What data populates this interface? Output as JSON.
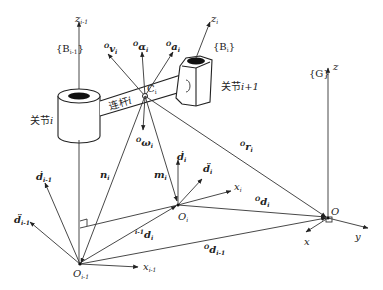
{
  "diagram": {
    "frames": {
      "B_im1": "{B",
      "B_im1_sub": "i-1",
      "B_im1_close": "}",
      "B_i": "{B",
      "B_i_sub": "i",
      "B_i_close": "}",
      "G": "{G}"
    },
    "axes": {
      "z_im1": "z",
      "z_im1_sub": "i-1",
      "z_i": "z",
      "z_i_sub": "i",
      "z_G": "z",
      "x_im1": "x",
      "x_im1_sub": "i-1",
      "x_i": "x",
      "x_i_sub": "i",
      "x_G": "x",
      "y_G": "y"
    },
    "points": {
      "O_im1": "O",
      "O_im1_sub": "i-1",
      "O_i": "O",
      "O_i_sub": "i",
      "O": "O",
      "C_i": "C",
      "C_i_sub": "i"
    },
    "components": {
      "joint_i": "关节",
      "joint_i_var": "i",
      "joint_ip1": "关节",
      "joint_ip1_var": "i+1",
      "link_i": "连杆",
      "link_i_var": "i"
    },
    "vectors": {
      "v_i": {
        "sup": "O",
        "name": "v",
        "sub": "i"
      },
      "alpha_i": {
        "sup": "O",
        "name": "α",
        "sub": "i"
      },
      "a_i": {
        "sup": "O",
        "name": "a",
        "sub": "i"
      },
      "omega_i": {
        "sup": "O",
        "name": "ω",
        "sub": "i"
      },
      "n_i": {
        "name": "n",
        "sub": "i"
      },
      "m_i": {
        "name": "m",
        "sub": "i"
      },
      "r_i": {
        "sup": "O",
        "name": "r",
        "sub": "i"
      },
      "d_i_dot": {
        "name": "ḋ",
        "sub": "i"
      },
      "d_i_ddot": {
        "name": "d̈",
        "sub": "i"
      },
      "d_im1_dot": {
        "name": "ḋ",
        "sub": "i-1"
      },
      "d_im1_ddot": {
        "name": "d̈",
        "sub": "i-1"
      },
      "im1_d_i": {
        "sup": "i-1",
        "name": "d",
        "sub": "i"
      },
      "O_d_i": {
        "sup": "O",
        "name": "d",
        "sub": "i"
      },
      "O_d_im1": {
        "sup": "O",
        "name": "d",
        "sub": "i-1"
      }
    }
  }
}
